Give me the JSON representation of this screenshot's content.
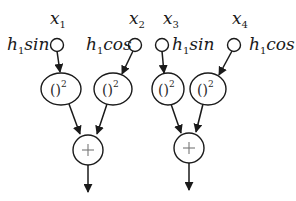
{
  "diagram": {
    "inputs": [
      {
        "var": "x",
        "sub": "1",
        "weight": "h",
        "weight_sub": "1",
        "func": "sin"
      },
      {
        "var": "x",
        "sub": "2",
        "weight": "h",
        "weight_sub": "1",
        "func": "cos"
      },
      {
        "var": "x",
        "sub": "3",
        "weight": "h",
        "weight_sub": "1",
        "func": "sin"
      },
      {
        "var": "x",
        "sub": "4",
        "weight": "h",
        "weight_sub": "1",
        "func": "cos"
      }
    ],
    "square_nodes": [
      {
        "base": "()",
        "exp": "2"
      },
      {
        "base": "()",
        "exp": "2"
      },
      {
        "base": "()",
        "exp": "2"
      },
      {
        "base": "()",
        "exp": "2"
      }
    ],
    "sum_nodes": [
      {
        "symbol": "+"
      },
      {
        "symbol": "+"
      }
    ],
    "colors": {
      "stroke": "#1a1a1a",
      "plus": "#777777"
    }
  }
}
